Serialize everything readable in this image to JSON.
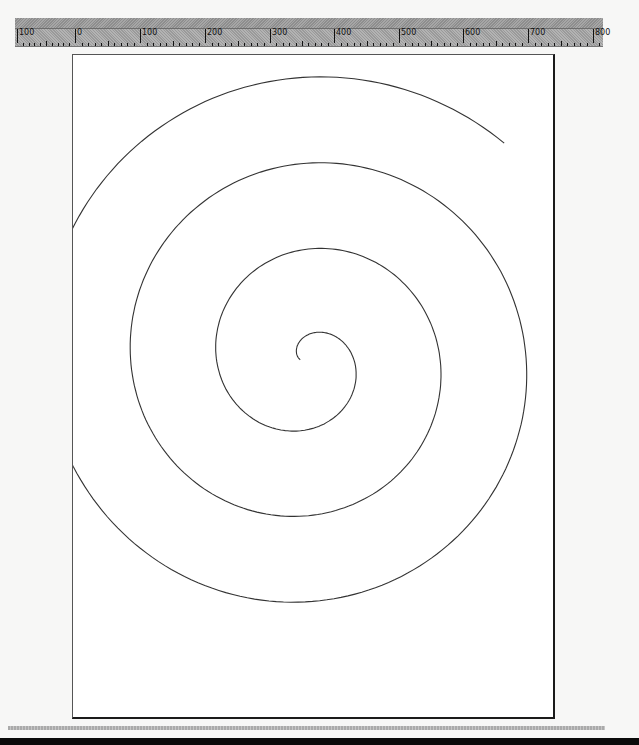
{
  "ruler": {
    "labels": [
      "100",
      "0",
      "100",
      "200",
      "300",
      "400",
      "500",
      "600",
      "700",
      "800"
    ],
    "label_positions_px": [
      17,
      75,
      140,
      205,
      270,
      334,
      399,
      463,
      528,
      593
    ],
    "unit_step": 100
  },
  "canvas": {
    "page_background": "#ffffff",
    "stroke_color": "#333333",
    "shape": "archimedean-spiral",
    "spiral": {
      "center": [
        296,
        358
      ],
      "start_point": [
        295,
        362
      ],
      "end_point": [
        370,
        607
      ],
      "turns": 3.4
    }
  },
  "colors": {
    "workspace": "#f7f7f6",
    "ruler": "#a8a8a8",
    "bottom_bar": "#0a0a0a"
  }
}
